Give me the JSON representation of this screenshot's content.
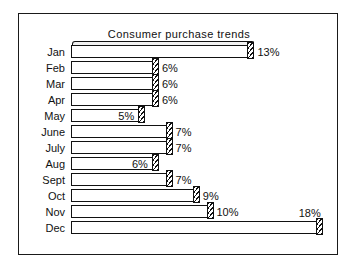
{
  "chart_data": {
    "type": "bar",
    "orientation": "horizontal",
    "title": "Consumer purchase trends",
    "xlabel": "",
    "ylabel": "",
    "categories": [
      "Jan",
      "Feb",
      "Mar",
      "Apr",
      "May",
      "June",
      "July",
      "Aug",
      "Sept",
      "Oct",
      "Nov",
      "Dec"
    ],
    "values": [
      13,
      6,
      6,
      6,
      5,
      7,
      7,
      6,
      7,
      9,
      10,
      18
    ],
    "data_labels": [
      "13%",
      "6%",
      "6%",
      "6%",
      "5%",
      "7%",
      "7%",
      "6%",
      "7%",
      "9%",
      "10%",
      "18%"
    ],
    "unit": "%",
    "xlim": [
      0,
      19
    ],
    "grid": false,
    "legend": false,
    "style": {
      "bar_fill": "#ffffff",
      "bar_outline": "#111111",
      "end_cap": "diagonal-hatch",
      "frame": "#1a1a1a",
      "background": "#ffffff"
    }
  },
  "chart": {
    "title": "Consumer purchase trends",
    "rows": [
      {
        "label": "Jan",
        "value": 13,
        "data_label": "13%",
        "label_pos": "outside",
        "cap_3d_top": true
      },
      {
        "label": "Feb",
        "value": 6,
        "data_label": "6%",
        "label_pos": "outside",
        "cap_3d_top": false
      },
      {
        "label": "Mar",
        "value": 6,
        "data_label": "6%",
        "label_pos": "outside",
        "cap_3d_top": false
      },
      {
        "label": "Apr",
        "value": 6,
        "data_label": "6%",
        "label_pos": "outside",
        "cap_3d_top": false
      },
      {
        "label": "May",
        "value": 5,
        "data_label": "5%",
        "label_pos": "inside",
        "cap_3d_top": false
      },
      {
        "label": "June",
        "value": 7,
        "data_label": "7%",
        "label_pos": "outside",
        "cap_3d_top": false
      },
      {
        "label": "July",
        "value": 7,
        "data_label": "7%",
        "label_pos": "outside",
        "cap_3d_top": false
      },
      {
        "label": "Aug",
        "value": 6,
        "data_label": "6%",
        "label_pos": "inside",
        "cap_3d_top": false
      },
      {
        "label": "Sept",
        "value": 7,
        "data_label": "7%",
        "label_pos": "outside",
        "cap_3d_top": false
      },
      {
        "label": "Oct",
        "value": 9,
        "data_label": "9%",
        "label_pos": "outside",
        "cap_3d_top": false
      },
      {
        "label": "Nov",
        "value": 10,
        "data_label": "10%",
        "label_pos": "outside",
        "cap_3d_top": false
      },
      {
        "label": "Dec",
        "value": 18,
        "data_label": "18%",
        "label_pos": "above",
        "cap_3d_top": false
      }
    ]
  }
}
